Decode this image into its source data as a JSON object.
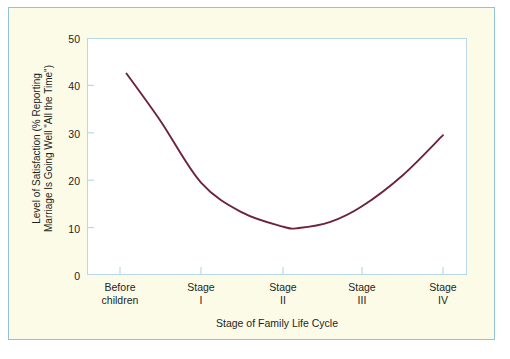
{
  "chart_data": {
    "type": "line",
    "title": "",
    "xlabel": "Stage of Family Life Cycle",
    "ylabel": "Level of Satisfaction (% Reporting\nMarriage Is Going Well \"All the Time\")",
    "categories": [
      "Before\nchildren",
      "Stage\nI",
      "Stage\nII",
      "Stage\nIII",
      "Stage\nIV"
    ],
    "x": [
      0,
      1,
      2,
      3,
      4
    ],
    "values": [
      42.5,
      19.5,
      10.2,
      14.5,
      29.5
    ],
    "series": [
      {
        "name": "Marital satisfaction",
        "values": [
          42.5,
          19.5,
          10.2,
          14.5,
          29.5
        ],
        "color": "#6b2438"
      }
    ],
    "ylim": [
      0,
      50
    ],
    "yticks": [
      0,
      10,
      20,
      30,
      40,
      50
    ],
    "ytick_labels": [
      "0",
      "10",
      "20",
      "30",
      "40",
      "50"
    ],
    "grid": false,
    "legend": "none",
    "curve_points": [
      {
        "x": 0.08,
        "y": 42.5
      },
      {
        "x": 0.5,
        "y": 32.5
      },
      {
        "x": 1.0,
        "y": 19.5
      },
      {
        "x": 1.5,
        "y": 13.2
      },
      {
        "x": 2.0,
        "y": 10.2
      },
      {
        "x": 2.2,
        "y": 9.9
      },
      {
        "x": 2.6,
        "y": 11.2
      },
      {
        "x": 3.0,
        "y": 14.5
      },
      {
        "x": 3.5,
        "y": 21.0
      },
      {
        "x": 4.0,
        "y": 29.5
      }
    ]
  },
  "figure": {
    "panel_background": "#fcfbe8",
    "plot_background": "#ffffff",
    "border_color": "#8fc3d8",
    "axis_color": "#b9d9e8",
    "text_color": "#231f20",
    "line_color": "#6b2438"
  }
}
